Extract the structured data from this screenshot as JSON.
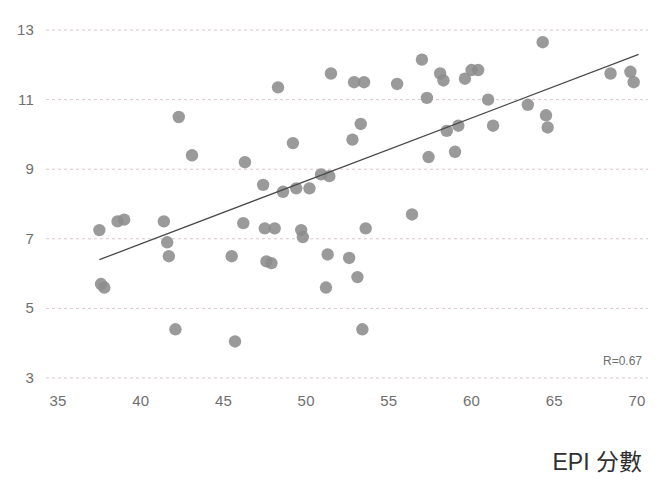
{
  "chart_data": {
    "type": "scatter",
    "title": "",
    "xlabel": "EPI 分數",
    "ylabel": "",
    "xlim": [
      34,
      71
    ],
    "ylim": [
      2.6,
      13.4
    ],
    "xticks": [
      35,
      40,
      45,
      50,
      55,
      60,
      65,
      70
    ],
    "yticks": [
      3,
      5,
      7,
      9,
      11,
      13
    ],
    "grid": "horizontal-dashed",
    "legend": "none",
    "annotations": [
      {
        "text": "R=0.67",
        "position": "bottom-right"
      }
    ],
    "marker_color": "#8c8c8c",
    "trendline_color": "#4a4a4a",
    "gridline_color": "#d9c9c9",
    "tick_color": "#6f6f6f",
    "trendline": {
      "type": "linear",
      "x_start": 37.5,
      "y_start": 6.4,
      "x_end": 70.1,
      "y_end": 12.3
    },
    "points": [
      {
        "x": 37.5,
        "y": 7.25
      },
      {
        "x": 37.6,
        "y": 5.7
      },
      {
        "x": 37.8,
        "y": 5.6
      },
      {
        "x": 38.6,
        "y": 7.5
      },
      {
        "x": 39.0,
        "y": 7.55
      },
      {
        "x": 41.4,
        "y": 7.5
      },
      {
        "x": 41.6,
        "y": 6.9
      },
      {
        "x": 41.7,
        "y": 6.5
      },
      {
        "x": 42.1,
        "y": 4.4
      },
      {
        "x": 42.3,
        "y": 10.5
      },
      {
        "x": 43.1,
        "y": 9.4
      },
      {
        "x": 45.5,
        "y": 6.5
      },
      {
        "x": 45.7,
        "y": 4.05
      },
      {
        "x": 46.2,
        "y": 7.45
      },
      {
        "x": 46.3,
        "y": 9.2
      },
      {
        "x": 47.4,
        "y": 8.55
      },
      {
        "x": 47.5,
        "y": 7.3
      },
      {
        "x": 47.6,
        "y": 6.35
      },
      {
        "x": 47.9,
        "y": 6.3
      },
      {
        "x": 48.1,
        "y": 7.3
      },
      {
        "x": 48.3,
        "y": 11.35
      },
      {
        "x": 48.6,
        "y": 8.35
      },
      {
        "x": 49.2,
        "y": 9.75
      },
      {
        "x": 49.4,
        "y": 8.45
      },
      {
        "x": 49.7,
        "y": 7.25
      },
      {
        "x": 49.8,
        "y": 7.05
      },
      {
        "x": 50.2,
        "y": 8.45
      },
      {
        "x": 50.9,
        "y": 8.85
      },
      {
        "x": 51.2,
        "y": 5.6
      },
      {
        "x": 51.3,
        "y": 6.55
      },
      {
        "x": 51.4,
        "y": 8.8
      },
      {
        "x": 51.5,
        "y": 11.75
      },
      {
        "x": 52.6,
        "y": 6.45
      },
      {
        "x": 52.8,
        "y": 9.85
      },
      {
        "x": 52.9,
        "y": 11.5
      },
      {
        "x": 53.1,
        "y": 5.9
      },
      {
        "x": 53.3,
        "y": 10.3
      },
      {
        "x": 53.4,
        "y": 4.4
      },
      {
        "x": 53.5,
        "y": 11.5
      },
      {
        "x": 53.6,
        "y": 7.3
      },
      {
        "x": 55.5,
        "y": 11.45
      },
      {
        "x": 56.4,
        "y": 7.7
      },
      {
        "x": 57.0,
        "y": 12.15
      },
      {
        "x": 57.3,
        "y": 11.05
      },
      {
        "x": 57.4,
        "y": 9.35
      },
      {
        "x": 58.1,
        "y": 11.75
      },
      {
        "x": 58.3,
        "y": 11.55
      },
      {
        "x": 58.5,
        "y": 10.1
      },
      {
        "x": 59.0,
        "y": 9.5
      },
      {
        "x": 59.2,
        "y": 10.25
      },
      {
        "x": 59.6,
        "y": 11.6
      },
      {
        "x": 60.0,
        "y": 11.85
      },
      {
        "x": 60.4,
        "y": 11.85
      },
      {
        "x": 61.0,
        "y": 11.0
      },
      {
        "x": 61.3,
        "y": 10.25
      },
      {
        "x": 63.4,
        "y": 10.85
      },
      {
        "x": 64.3,
        "y": 12.65
      },
      {
        "x": 64.5,
        "y": 10.55
      },
      {
        "x": 64.6,
        "y": 10.2
      },
      {
        "x": 68.4,
        "y": 11.75
      },
      {
        "x": 69.6,
        "y": 11.8
      },
      {
        "x": 69.8,
        "y": 11.5
      }
    ]
  },
  "axis": {
    "x_tick_labels": [
      "35",
      "40",
      "45",
      "50",
      "55",
      "60",
      "65",
      "70"
    ],
    "y_tick_labels": [
      "13",
      "11",
      "9",
      "7",
      "5",
      "3"
    ],
    "x_title": "EPI 分數"
  },
  "annotation": {
    "correlation": "R=0.67"
  }
}
